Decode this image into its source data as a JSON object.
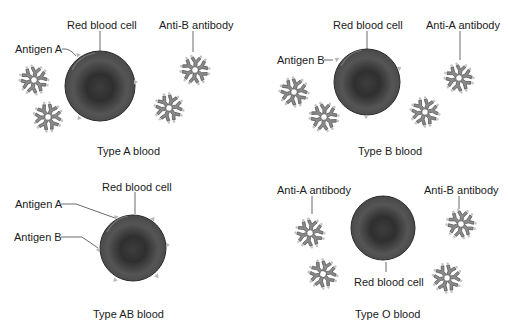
{
  "panels": [
    {
      "id": "type-a",
      "caption": "Type A blood",
      "labels": {
        "cell": "Red blood cell",
        "antigen": "Antigen A",
        "antibody": "Anti-B antibody"
      }
    },
    {
      "id": "type-b",
      "caption": "Type B blood",
      "labels": {
        "cell": "Red blood cell",
        "antigen": "Antigen B",
        "antibody": "Anti-A antibody"
      }
    },
    {
      "id": "type-ab",
      "caption": "Type AB blood",
      "labels": {
        "cell": "Red blood cell",
        "antigen_a": "Antigen A",
        "antigen_b": "Antigen B"
      }
    },
    {
      "id": "type-o",
      "caption": "Type O blood",
      "labels": {
        "cell": "Red blood cell",
        "antibody_a": "Anti-A antibody",
        "antibody_b": "Anti-B antibody"
      }
    }
  ],
  "colors": {
    "cell_dark": "#3a3a3a",
    "cell_mid": "#5c5c5c",
    "cell_rim": "#6e6e6e",
    "antibody_fill": "#8a8a8a",
    "antibody_stroke": "#555555",
    "antigen": "#b8b8b8",
    "leader_line": "#444444"
  }
}
